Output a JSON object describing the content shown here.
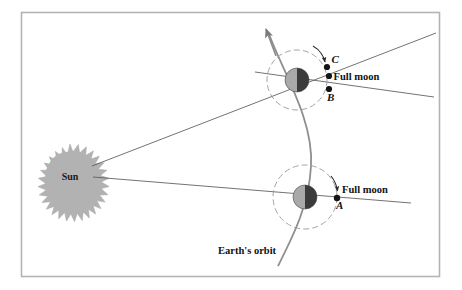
{
  "figure": {
    "frame": {
      "border_color": "#b4b4b4",
      "background": "#ffffff"
    }
  },
  "labels": {
    "sun": "Sun",
    "earths_orbit": "Earth's orbit",
    "full_moon_upper": "Full moon",
    "full_moon_lower": "Full moon",
    "point_a": "A",
    "point_b": "B",
    "point_c": "C"
  },
  "colors": {
    "sun_fill": "#b0b0b0",
    "sun_stroke": "#a0a0a0",
    "earth_light": "#a8a8a8",
    "earth_dark": "#3a3a3a",
    "line": "#555555",
    "orbit_curve": "#8a8a8a",
    "dashed_circle": "#909090",
    "moon_dot": "#141414",
    "frame": "#b4b4b4",
    "text": "#111111"
  },
  "geometry": {
    "sun": {
      "cx": 70,
      "cy": 176,
      "r_inner": 24,
      "r_spike": 32,
      "spikes": 34
    },
    "earth_upper": {
      "cx": 297,
      "cy": 80,
      "r": 12
    },
    "earth_lower": {
      "cx": 305,
      "cy": 197,
      "r": 12
    },
    "moon_orbit_upper": {
      "cx": 297,
      "cy": 80,
      "r": 30
    },
    "moon_orbit_lower": {
      "cx": 305,
      "cy": 197,
      "r": 32
    },
    "moon_c": {
      "cx": 327,
      "cy": 67
    },
    "moon_b": {
      "cx": 329,
      "cy": 89
    },
    "moon_a": {
      "cx": 337,
      "cy": 198
    }
  },
  "elements": {
    "orbit_arrow_direction": "up-left",
    "moon_arrow_upper": "counterclockwise-arc-near-C",
    "moon_arrow_lower": "counterclockwise-arc-near-A"
  }
}
